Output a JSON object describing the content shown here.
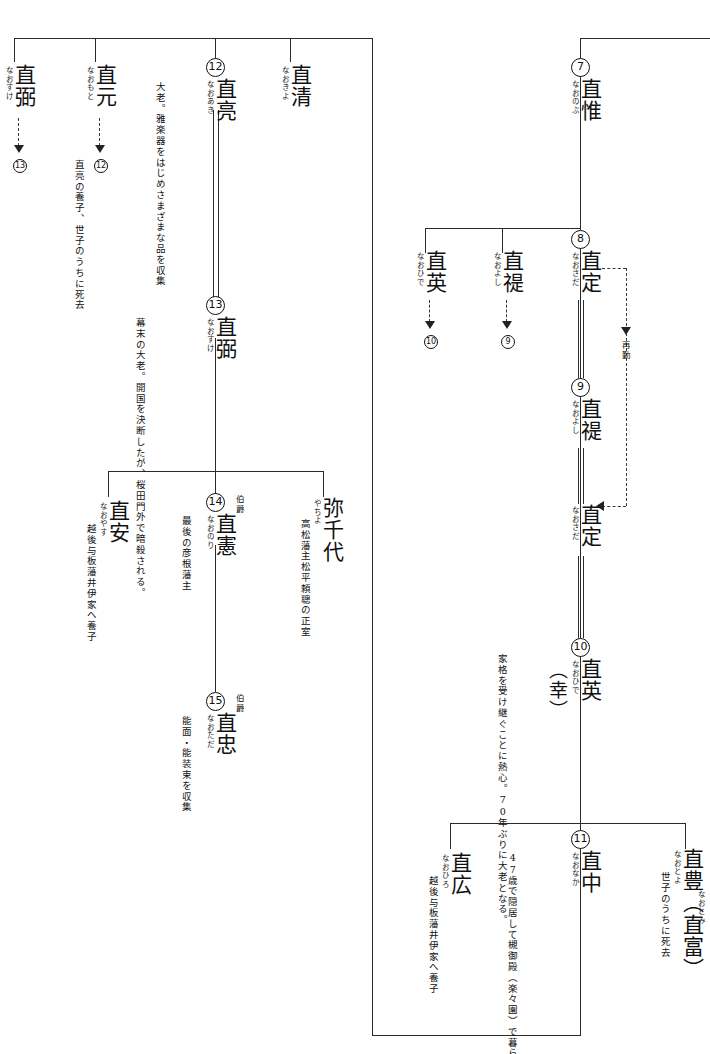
{
  "document": {
    "kind": "family-tree",
    "family": "井伊家系図",
    "script": "vertical-japanese"
  },
  "people": {
    "naosuke_left": {
      "name": "直弼",
      "yomi": "なおすけ",
      "link_to": "13"
    },
    "naomoto": {
      "name": "直元",
      "yomi": "なおもと",
      "link_to": "12",
      "note": "直亮の養子、世子のうちに死去"
    },
    "naoaki": {
      "gen": "12",
      "name": "直亮",
      "yomi": "なおあき",
      "note": "大老。雅楽器をはじめさまざまな品を収集"
    },
    "naokiyo": {
      "name": "直清",
      "yomi": "なおきよ"
    },
    "naosuke13": {
      "gen": "13",
      "name": "直弼",
      "yomi": "なおすけ",
      "note": "幕末の大老。開国を決断したが、桜田門外で暗殺される。"
    },
    "naoyasu": {
      "name": "直安",
      "yomi": "なおやす",
      "note": "越後与板藩井伊家へ養子"
    },
    "naonori": {
      "gen": "14",
      "rank": "伯爵",
      "name": "直憲",
      "yomi": "なおのり",
      "note": "最後の彦根藩主"
    },
    "yachiyo": {
      "name": "弥千代",
      "yomi": "やちよ",
      "note": "高松藩主松平頼聰の正室"
    },
    "naotada": {
      "gen": "15",
      "rank": "伯爵",
      "name": "直忠",
      "yomi": "なおただ",
      "note": "能面・能装束を収集"
    },
    "naonobu": {
      "gen": "7",
      "name": "直惟",
      "yomi": "なおのぶ"
    },
    "naohide_b": {
      "name": "直英",
      "yomi": "なおひで",
      "link_to": "10"
    },
    "naoyoshi_b": {
      "name": "直禔",
      "yomi": "なおよし",
      "link_to": "9"
    },
    "naosada8": {
      "gen": "8",
      "name": "直定",
      "yomi": "なおさだ"
    },
    "naoyoshi9": {
      "gen": "9",
      "name": "直禔",
      "yomi": "なおよし"
    },
    "naosada_again": {
      "name": "直定",
      "yomi": "なおさだ",
      "reappoint_label": "再勤"
    },
    "naohide10": {
      "gen": "10",
      "name": "直英",
      "alt_name": "（幸）",
      "yomi": "なおひで",
      "note": "家格を受け継ぐことに熱心。70年ぶりに大老となる。"
    },
    "naohiro": {
      "name": "直広",
      "yomi": "なおひろ",
      "note": "越後与板藩井伊家へ養子"
    },
    "naonaka11": {
      "gen": "11",
      "name": "直中",
      "yomi": "なおなか",
      "note": "47歳で隠居して槻御殿（楽々園）で暮らし、趣味の日々をすごす"
    },
    "naotoyo": {
      "name": "直豊（直富）",
      "yomi_1": "なおとよ",
      "yomi_2": "なおとみ",
      "note": "世子のうちに死去"
    }
  },
  "colors": {
    "ink": "#2b2b2b",
    "paper": "#ffffff"
  }
}
